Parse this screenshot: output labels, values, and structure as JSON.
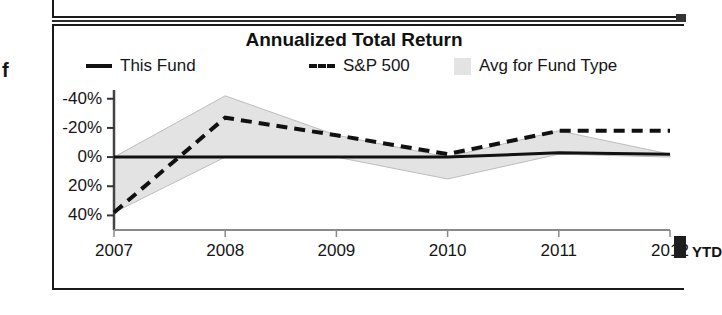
{
  "page": {
    "stray_glyph": "f"
  },
  "chart": {
    "title": "Annualized Total Return",
    "legend": [
      {
        "key": "this-fund",
        "label": "This Fund",
        "marker": "solid-line",
        "color": "#111111"
      },
      {
        "key": "sp500",
        "label": "S&P 500",
        "marker": "dashed-line",
        "color": "#111111"
      },
      {
        "key": "avg-fund-type",
        "label": "Avg for Fund Type",
        "marker": "filled-swatch",
        "color": "#e3e3e3"
      }
    ],
    "y_axis": {
      "ticks": [
        "40%",
        "20%",
        "0%",
        "-20%",
        "-40%"
      ]
    },
    "x_axis": {
      "ticks": [
        "2007",
        "2008",
        "2009",
        "2010",
        "2011",
        "2012"
      ],
      "suffix": "YTD"
    }
  },
  "chart_data": {
    "type": "line",
    "title": "Annualized Total Return",
    "xlabel": "",
    "ylabel": "",
    "x": [
      "2007",
      "2008",
      "2009",
      "2010",
      "2011",
      "2012"
    ],
    "categories": [
      "2007",
      "2008",
      "2009",
      "2010",
      "2011",
      "2012"
    ],
    "ylim": [
      -50,
      46
    ],
    "yticks": [
      -40,
      -20,
      0,
      20,
      40
    ],
    "ytick_labels": [
      "-40%",
      "-20%",
      "0%",
      "20%",
      "40%"
    ],
    "grid": false,
    "legend_position": "top",
    "series": [
      {
        "name": "This Fund",
        "style": "solid",
        "color": "#111111",
        "values": [
          0,
          0,
          0,
          0,
          3,
          2
        ]
      },
      {
        "name": "S&P 500",
        "style": "dashed",
        "color": "#111111",
        "values": [
          -38,
          27,
          15,
          2,
          18,
          18
        ]
      },
      {
        "name": "Avg for Fund Type",
        "style": "band",
        "color": "#e3e3e3",
        "note": "shaded region bounded by the fund-type average and the reference line",
        "upper": [
          0,
          42,
          15,
          0,
          18,
          2
        ],
        "lower": [
          -38,
          0,
          0,
          -15,
          2,
          0
        ],
        "values": [
          -38,
          42,
          15,
          -15,
          18,
          2
        ]
      }
    ],
    "annotations": [
      {
        "text": "YTD",
        "x": "2012",
        "note": "year-to-date marker at right edge of x-axis"
      }
    ]
  }
}
